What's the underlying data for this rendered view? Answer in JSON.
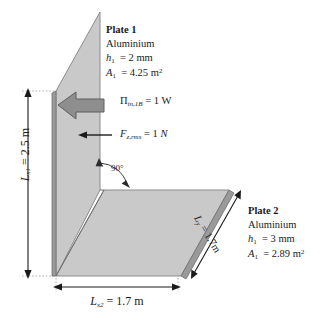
{
  "figure": {
    "type": "engineering-diagram"
  },
  "plate1": {
    "title": "Plate 1",
    "material": "Aluminium",
    "thickness_symbol": "h",
    "thickness_sub": "1",
    "thickness_value": "= 2 mm",
    "area_symbol": "A",
    "area_sub": "1",
    "area_value": "= 4.25 m",
    "area_exp": "2"
  },
  "plate2": {
    "title": "Plate 2",
    "material": "Aluminium",
    "thickness_symbol": "h",
    "thickness_sub": "1",
    "thickness_value": "= 3 mm",
    "area_symbol": "A",
    "area_sub": "1",
    "area_value": "= 2.89 m",
    "area_exp": "2"
  },
  "excitation": {
    "power_symbol": "Π",
    "power_sub": "in,1B",
    "power_value": "= 1 W",
    "force_symbol": "F",
    "force_sub": "z,rms",
    "force_value": "= 1 ",
    "force_unit": "N"
  },
  "angle": {
    "label": "90°"
  },
  "dimensions": {
    "lx1_symbol": "L",
    "lx1_sub": "x1",
    "lx1_value": "= 2.5 m",
    "lx2_symbol": "L",
    "lx2_sub": "x2",
    "lx2_value": "= 1.7 m",
    "ly_symbol": "L",
    "ly_sub": "y",
    "ly_value": "= 1.7m"
  },
  "colors": {
    "plate_fill": "#c9c9c9",
    "plate_edge": "#9a9a9a",
    "arrow_fill": "#8e8e8e",
    "line": "#1a1a1a",
    "extension": "#a8a8a8"
  }
}
